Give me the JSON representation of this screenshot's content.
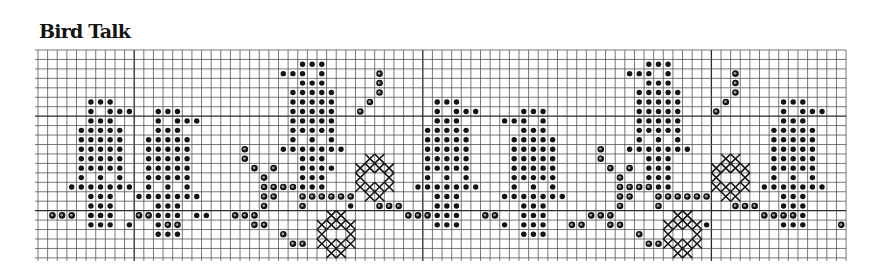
{
  "title": "Bird Talk",
  "grid": {
    "origin_x": 38,
    "origin_y": 50,
    "cell_w": 9.62,
    "cell_h": 9.45,
    "cols": 84,
    "rows": 22,
    "line_color": "#555555",
    "bold_line_color": "#2a2a2a",
    "bold_every_cols": [
      10,
      40,
      70
    ],
    "bold_rows": [
      7,
      17
    ]
  },
  "colors": {
    "ink": "#141414",
    "paper": "#ffffff"
  },
  "motifs": {
    "bird_right": {
      "solid": [
        [
          1,
          0
        ],
        [
          2,
          0
        ],
        [
          3,
          0
        ],
        [
          1,
          1
        ],
        [
          3,
          1
        ],
        [
          4,
          1
        ],
        [
          5,
          1
        ],
        [
          1,
          2
        ],
        [
          2,
          2
        ],
        [
          3,
          2
        ],
        [
          0,
          3
        ],
        [
          1,
          3
        ],
        [
          2,
          3
        ],
        [
          3,
          3
        ],
        [
          4,
          3
        ],
        [
          0,
          4
        ],
        [
          1,
          4
        ],
        [
          2,
          4
        ],
        [
          3,
          4
        ],
        [
          4,
          4
        ],
        [
          0,
          5
        ],
        [
          1,
          5
        ],
        [
          2,
          5
        ],
        [
          3,
          5
        ],
        [
          4,
          5
        ],
        [
          0,
          6
        ],
        [
          1,
          6
        ],
        [
          2,
          6
        ],
        [
          3,
          6
        ],
        [
          4,
          6
        ],
        [
          0,
          7
        ],
        [
          1,
          7
        ],
        [
          2,
          7
        ],
        [
          3,
          7
        ],
        [
          4,
          7
        ],
        [
          0,
          8
        ],
        [
          2,
          8
        ],
        [
          4,
          8
        ],
        [
          -1,
          9
        ],
        [
          0,
          9
        ],
        [
          1,
          9
        ],
        [
          2,
          9
        ],
        [
          3,
          9
        ],
        [
          4,
          9
        ],
        [
          5,
          9
        ],
        [
          1,
          10
        ],
        [
          2,
          10
        ],
        [
          3,
          10
        ],
        [
          1,
          11
        ],
        [
          2,
          11
        ],
        [
          3,
          11
        ],
        [
          1,
          12
        ],
        [
          2,
          12
        ],
        [
          3,
          12
        ],
        [
          1,
          13
        ],
        [
          2,
          13
        ],
        [
          3,
          13
        ]
      ]
    },
    "bird_left": {
      "solid": [
        [
          2,
          0
        ],
        [
          3,
          0
        ],
        [
          4,
          0
        ],
        [
          0,
          1
        ],
        [
          1,
          1
        ],
        [
          2,
          1
        ],
        [
          4,
          1
        ],
        [
          2,
          2
        ],
        [
          3,
          2
        ],
        [
          4,
          2
        ],
        [
          1,
          3
        ],
        [
          2,
          3
        ],
        [
          3,
          3
        ],
        [
          4,
          3
        ],
        [
          5,
          3
        ],
        [
          1,
          4
        ],
        [
          2,
          4
        ],
        [
          3,
          4
        ],
        [
          4,
          4
        ],
        [
          5,
          4
        ],
        [
          1,
          5
        ],
        [
          2,
          5
        ],
        [
          3,
          5
        ],
        [
          4,
          5
        ],
        [
          5,
          5
        ],
        [
          1,
          6
        ],
        [
          2,
          6
        ],
        [
          3,
          6
        ],
        [
          4,
          6
        ],
        [
          5,
          6
        ],
        [
          1,
          7
        ],
        [
          2,
          7
        ],
        [
          3,
          7
        ],
        [
          4,
          7
        ],
        [
          5,
          7
        ],
        [
          1,
          8
        ],
        [
          3,
          8
        ],
        [
          5,
          8
        ],
        [
          0,
          9
        ],
        [
          1,
          9
        ],
        [
          2,
          9
        ],
        [
          3,
          9
        ],
        [
          4,
          9
        ],
        [
          5,
          9
        ],
        [
          6,
          9
        ],
        [
          2,
          10
        ],
        [
          3,
          10
        ],
        [
          4,
          10
        ],
        [
          2,
          11
        ],
        [
          3,
          11
        ],
        [
          4,
          11
        ],
        [
          2,
          12
        ],
        [
          3,
          12
        ],
        [
          4,
          12
        ],
        [
          2,
          13
        ],
        [
          3,
          13
        ],
        [
          4,
          13
        ]
      ]
    },
    "cross_diamond": [
      [
        1,
        0
      ],
      [
        2,
        0
      ],
      [
        0,
        1
      ],
      [
        1,
        1
      ],
      [
        2,
        1
      ],
      [
        3,
        1
      ],
      [
        0,
        2
      ],
      [
        3,
        2
      ],
      [
        0,
        3
      ],
      [
        1,
        3
      ],
      [
        2,
        3
      ],
      [
        3,
        3
      ],
      [
        1,
        4
      ],
      [
        2,
        4
      ]
    ]
  },
  "placements": {
    "birds": [
      {
        "name": "bird-1",
        "motif": "bird_right",
        "col": 4,
        "row": 5
      },
      {
        "name": "bird-2",
        "motif": "bird_right",
        "col": 11,
        "row": 6
      },
      {
        "name": "bird-3",
        "motif": "bird_left",
        "col": 25,
        "row": 1
      },
      {
        "name": "bird-4",
        "motif": "bird_right",
        "col": 40,
        "row": 5
      },
      {
        "name": "bird-5",
        "motif": "bird_left",
        "col": 48,
        "row": 6
      },
      {
        "name": "bird-6",
        "motif": "bird_left",
        "col": 61,
        "row": 1
      },
      {
        "name": "bird-7",
        "motif": "bird_right",
        "col": 76,
        "row": 5
      }
    ],
    "crosses": [
      {
        "name": "cross-1",
        "col": 33,
        "row": 11
      },
      {
        "name": "cross-2",
        "col": 29,
        "row": 17
      },
      {
        "name": "cross-3",
        "col": 70,
        "row": 11
      },
      {
        "name": "cross-4",
        "col": 65,
        "row": 17
      }
    ]
  },
  "outline_dots": [
    [
      1,
      17
    ],
    [
      2,
      17
    ],
    [
      3,
      17
    ],
    [
      10,
      17
    ],
    [
      11,
      17
    ],
    [
      13,
      18
    ],
    [
      14,
      18
    ],
    [
      20,
      17
    ],
    [
      21,
      17
    ],
    [
      22,
      17
    ],
    [
      23,
      16
    ],
    [
      24,
      15
    ],
    [
      22,
      18
    ],
    [
      23,
      18
    ],
    [
      25,
      19
    ],
    [
      26,
      20
    ],
    [
      27,
      20
    ],
    [
      21,
      10
    ],
    [
      21,
      11
    ],
    [
      22,
      12
    ],
    [
      24,
      12
    ],
    [
      23,
      13
    ],
    [
      23,
      14
    ],
    [
      24,
      14
    ],
    [
      25,
      14
    ],
    [
      26,
      14
    ],
    [
      23,
      15
    ],
    [
      27,
      15
    ],
    [
      28,
      15
    ],
    [
      29,
      15
    ],
    [
      30,
      15
    ],
    [
      31,
      15
    ],
    [
      32,
      15
    ],
    [
      27,
      16
    ],
    [
      33,
      6
    ],
    [
      34,
      5
    ],
    [
      35,
      4
    ],
    [
      35,
      3
    ],
    [
      35,
      2
    ],
    [
      35,
      16
    ],
    [
      36,
      16
    ],
    [
      37,
      16
    ],
    [
      38,
      17
    ],
    [
      39,
      17
    ],
    [
      40,
      17
    ],
    [
      46,
      17
    ],
    [
      47,
      17
    ],
    [
      55,
      18
    ],
    [
      56,
      18
    ],
    [
      57,
      17
    ],
    [
      58,
      17
    ],
    [
      59,
      17
    ],
    [
      60,
      16
    ],
    [
      61,
      15
    ],
    [
      59,
      18
    ],
    [
      60,
      18
    ],
    [
      62,
      19
    ],
    [
      63,
      20
    ],
    [
      64,
      20
    ],
    [
      58,
      10
    ],
    [
      58,
      11
    ],
    [
      59,
      12
    ],
    [
      61,
      12
    ],
    [
      60,
      13
    ],
    [
      60,
      14
    ],
    [
      61,
      14
    ],
    [
      62,
      14
    ],
    [
      63,
      14
    ],
    [
      60,
      15
    ],
    [
      64,
      15
    ],
    [
      65,
      15
    ],
    [
      66,
      15
    ],
    [
      67,
      15
    ],
    [
      68,
      15
    ],
    [
      69,
      15
    ],
    [
      64,
      16
    ],
    [
      70,
      6
    ],
    [
      71,
      5
    ],
    [
      72,
      4
    ],
    [
      72,
      3
    ],
    [
      72,
      2
    ],
    [
      72,
      16
    ],
    [
      73,
      16
    ],
    [
      74,
      16
    ],
    [
      75,
      17
    ],
    [
      76,
      17
    ],
    [
      77,
      17
    ],
    [
      78,
      17
    ],
    [
      84,
      17
    ],
    [
      85,
      17
    ],
    [
      83,
      18
    ]
  ],
  "solid_extra": [
    [
      5,
      17
    ],
    [
      6,
      17
    ],
    [
      9,
      18
    ],
    [
      16,
      17
    ],
    [
      17,
      17
    ],
    [
      30,
      12
    ],
    [
      32,
      16
    ],
    [
      48,
      18
    ],
    [
      69,
      18
    ]
  ]
}
